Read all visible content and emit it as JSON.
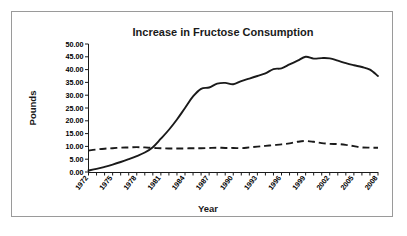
{
  "chart_data": {
    "type": "line",
    "title": "Increase in Fructose Consumption",
    "xlabel": "Year",
    "ylabel": "Pounds",
    "xlim": [
      1972,
      2008
    ],
    "ylim": [
      0,
      50
    ],
    "grid": false,
    "legend": "none",
    "y_ticks": [
      "0.00",
      "5.00",
      "10.00",
      "15.00",
      "20.00",
      "25.00",
      "30.00",
      "35.00",
      "40.00",
      "45.00",
      "50.00"
    ],
    "y_tick_values": [
      0,
      5,
      10,
      15,
      20,
      25,
      30,
      35,
      40,
      45,
      50
    ],
    "x_tick_labels": [
      "1972",
      "1975",
      "1978",
      "1981",
      "1984",
      "1987",
      "1990",
      "1993",
      "1996",
      "1999",
      "2002",
      "2005",
      "2008"
    ],
    "x_tick_values": [
      1972,
      1975,
      1978,
      1981,
      1984,
      1987,
      1990,
      1993,
      1996,
      1999,
      2002,
      2005,
      2008
    ],
    "x_minor_ticks": [
      1972,
      1973,
      1974,
      1975,
      1976,
      1977,
      1978,
      1979,
      1980,
      1981,
      1982,
      1983,
      1984,
      1985,
      1986,
      1987,
      1988,
      1989,
      1990,
      1991,
      1992,
      1993,
      1994,
      1995,
      1996,
      1997,
      1998,
      1999,
      2000,
      2001,
      2002,
      2003,
      2004,
      2005,
      2006,
      2007,
      2008
    ],
    "x": [
      1972,
      1973,
      1974,
      1975,
      1976,
      1977,
      1978,
      1979,
      1980,
      1981,
      1982,
      1983,
      1984,
      1985,
      1986,
      1987,
      1988,
      1989,
      1990,
      1991,
      1992,
      1993,
      1994,
      1995,
      1996,
      1997,
      1998,
      1999,
      2000,
      2001,
      2002,
      2003,
      2004,
      2005,
      2006,
      2007,
      2008
    ],
    "series": [
      {
        "name": "Fructose",
        "style": "solid",
        "color": "#1a1a1a",
        "values": [
          0.6,
          1.2,
          2.0,
          2.9,
          3.9,
          5.0,
          6.2,
          7.6,
          9.7,
          13.0,
          16.5,
          20.5,
          25.0,
          29.5,
          32.5,
          33.0,
          34.5,
          34.8,
          34.3,
          35.5,
          36.5,
          37.5,
          38.5,
          40.2,
          40.5,
          42.0,
          43.5,
          45.0,
          44.3,
          44.5,
          44.4,
          43.5,
          42.5,
          41.7,
          41.0,
          40.0,
          37.5
        ]
      },
      {
        "name": "Other sweetener",
        "style": "dashed",
        "color": "#1a1a1a",
        "values": [
          8.4,
          8.8,
          9.1,
          9.3,
          9.5,
          9.6,
          9.7,
          9.6,
          9.4,
          9.3,
          9.2,
          9.2,
          9.2,
          9.3,
          9.3,
          9.4,
          9.5,
          9.4,
          9.4,
          9.3,
          9.6,
          9.9,
          10.2,
          10.5,
          10.8,
          11.2,
          11.8,
          12.1,
          11.8,
          11.3,
          11.0,
          10.9,
          10.6,
          10.1,
          9.6,
          9.5,
          9.5
        ]
      }
    ]
  }
}
